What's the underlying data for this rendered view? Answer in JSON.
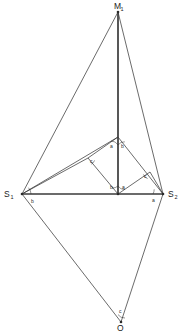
{
  "figure": {
    "type": "geometry-diagram",
    "width": 185,
    "height": 334,
    "background_color": "#ffffff",
    "stroke_color": "#2b2b2b",
    "bold_stroke_color": "#3a3a3a",
    "label_color": "#1a1a1a"
  },
  "vertices": {
    "apex": {
      "name": "M",
      "subscript": "1",
      "x": 118,
      "y": 12,
      "label_x": 114,
      "label_y": 9
    },
    "left": {
      "name": "S",
      "subscript": "1",
      "x": 22,
      "y": 194,
      "label_x": 4,
      "label_y": 197
    },
    "right": {
      "name": "S",
      "subscript": "2",
      "x": 163,
      "y": 194,
      "label_x": 168,
      "label_y": 197
    },
    "bottom": {
      "name": "O",
      "subscript": "",
      "x": 121,
      "y": 322,
      "label_x": 117,
      "label_y": 331
    },
    "center": {
      "name": "",
      "subscript": "",
      "x": 118,
      "y": 194
    },
    "inner_top": {
      "name": "",
      "subscript": "",
      "x": 118,
      "y": 137
    },
    "inner_left": {
      "name": "",
      "subscript": "",
      "x": 88,
      "y": 158
    },
    "inner_right": {
      "name": "",
      "subscript": "",
      "x": 150,
      "y": 172
    }
  },
  "edges": [
    {
      "id": "m1-s1",
      "from": "apex",
      "to": "left",
      "weight": "thin"
    },
    {
      "id": "m1-s2",
      "from": "apex",
      "to": "right",
      "weight": "thin"
    },
    {
      "id": "m1-center",
      "from": "apex",
      "to": "center",
      "weight": "bold"
    },
    {
      "id": "s1-s2",
      "from": "left",
      "to": "right",
      "weight": "bold"
    },
    {
      "id": "s1-o",
      "from": "left",
      "to": "bottom",
      "weight": "thin"
    },
    {
      "id": "s2-o",
      "from": "right",
      "to": "bottom",
      "weight": "thin"
    },
    {
      "id": "s1-innertop",
      "from": "left",
      "to": "inner_top",
      "weight": "thin"
    },
    {
      "id": "s1-innerleft",
      "from": "left",
      "to": "inner_left",
      "weight": "thin"
    },
    {
      "id": "innerleft-innertop",
      "from": "inner_left",
      "to": "inner_top",
      "weight": "thin"
    },
    {
      "id": "center-innerleft",
      "from": "center",
      "to": "inner_left",
      "weight": "thin"
    },
    {
      "id": "innertop-s2",
      "from": "inner_top",
      "to": "right",
      "weight": "thin"
    },
    {
      "id": "center-innerright",
      "from": "center",
      "to": "inner_right",
      "weight": "thin"
    },
    {
      "id": "innerright-s2",
      "from": "inner_right",
      "to": "right",
      "weight": "thin"
    }
  ],
  "angle_labels": [
    {
      "id": "s1-b",
      "text": "b",
      "x": 31,
      "y": 203
    },
    {
      "id": "s2-a",
      "text": "a",
      "x": 152,
      "y": 202
    },
    {
      "id": "innertop-a",
      "text": "a",
      "x": 110,
      "y": 148
    },
    {
      "id": "innertop-b",
      "text": "b",
      "x": 121,
      "y": 148
    },
    {
      "id": "innerleft-c",
      "text": "c",
      "x": 90,
      "y": 163
    },
    {
      "id": "innerright-c",
      "text": "c",
      "x": 144,
      "y": 178
    },
    {
      "id": "center-b",
      "text": "b",
      "x": 110,
      "y": 189
    },
    {
      "id": "center-a",
      "text": "a",
      "x": 122,
      "y": 189
    },
    {
      "id": "bottom-c",
      "text": "c",
      "x": 119,
      "y": 313
    }
  ],
  "angle_arcs": [
    {
      "id": "arc-s1",
      "cx": 22,
      "cy": 194,
      "r": 9,
      "start_deg": 0,
      "end_deg": 44
    },
    {
      "id": "arc-s2",
      "cx": 163,
      "cy": 194,
      "r": 10,
      "start_deg": 152,
      "end_deg": 180
    },
    {
      "id": "arc-innertop-left",
      "cx": 118,
      "cy": 137,
      "r": 8,
      "start_deg": 90,
      "end_deg": 150
    },
    {
      "id": "arc-innertop-right",
      "cx": 118,
      "cy": 137,
      "r": 8,
      "start_deg": 32,
      "end_deg": 90
    },
    {
      "id": "arc-innerleft",
      "cx": 88,
      "cy": 158,
      "r": 7,
      "start_deg": 297,
      "end_deg": 20
    },
    {
      "id": "arc-innerright",
      "cx": 150,
      "cy": 172,
      "r": 7,
      "start_deg": 200,
      "end_deg": 290
    },
    {
      "id": "arc-center-left",
      "cx": 118,
      "cy": 194,
      "r": 8,
      "start_deg": 222,
      "end_deg": 270
    },
    {
      "id": "arc-center-right",
      "cx": 118,
      "cy": 194,
      "r": 8,
      "start_deg": 270,
      "end_deg": 330
    },
    {
      "id": "arc-bottom",
      "cx": 121,
      "cy": 322,
      "r": 8,
      "start_deg": 248,
      "end_deg": 300
    }
  ]
}
